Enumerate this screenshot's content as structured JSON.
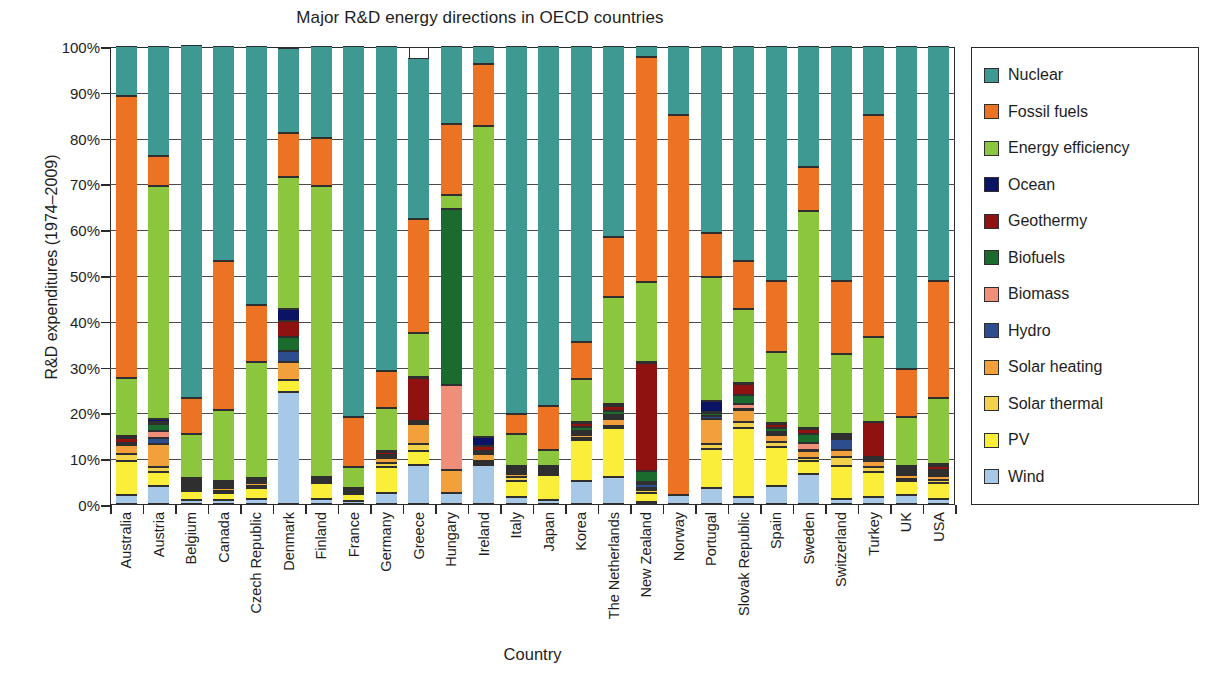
{
  "chart_data": {
    "type": "bar",
    "subtype": "stacked-100-percent",
    "title": "Major R&D energy directions in OECD countries",
    "xlabel": "Country",
    "ylabel": "R&D expenditures (1974–2009)",
    "ylim": [
      0,
      100
    ],
    "ytick_labels": [
      "0%",
      "10%",
      "20%",
      "30%",
      "40%",
      "50%",
      "60%",
      "70%",
      "80%",
      "90%",
      "100%"
    ],
    "ytick_values": [
      0,
      10,
      20,
      30,
      40,
      50,
      60,
      70,
      80,
      90,
      100
    ],
    "grid": true,
    "legend_position": "right",
    "legend_order_top_to_bottom": [
      "Nuclear",
      "Fossil fuels",
      "Energy efficiency",
      "Ocean",
      "Geothermy",
      "Biofuels",
      "Biomass",
      "Hydro",
      "Solar heating",
      "Solar thermal",
      "PV",
      "Wind"
    ],
    "series_colors": {
      "Nuclear": "#3d9991",
      "Fossil fuels": "#ed7324",
      "Energy efficiency": "#8cc63f",
      "Ocean": "#0b1464",
      "Geothermy": "#8f1110",
      "Biofuels": "#1b6b2e",
      "Biomass": "#f08f79",
      "Hydro": "#2e4d8f",
      "Solar heating": "#f2a03c",
      "Solar thermal": "#f2d14b",
      "PV": "#fbee3b",
      "Wind": "#a8c8e8"
    },
    "categories": [
      "Australia",
      "Austria",
      "Belgium",
      "Canada",
      "Czech Republic",
      "Denmark",
      "Finland",
      "France",
      "Germany",
      "Greece",
      "Hungary",
      "Ireland",
      "Italy",
      "Japan",
      "Korea",
      "The Netherlands",
      "New Zealand",
      "Norway",
      "Portugal",
      "Slovak Republic",
      "Spain",
      "Sweden",
      "Switzerland",
      "Turkey",
      "UK",
      "USA"
    ],
    "series": [
      {
        "name": "Wind",
        "values": [
          2.0,
          4.0,
          0.8,
          0.8,
          1.0,
          24.5,
          1.0,
          0.6,
          2.5,
          8.5,
          2.5,
          8.5,
          1.5,
          0.8,
          5.0,
          6.0,
          0.5,
          2.0,
          3.5,
          1.5,
          4.0,
          6.5,
          1.2,
          1.5,
          2.0,
          1.0
        ]
      },
      {
        "name": "PV",
        "values": [
          7.5,
          3.0,
          2.0,
          1.5,
          2.5,
          2.5,
          3.5,
          1.5,
          5.5,
          3.0,
          0.0,
          0.5,
          3.5,
          5.5,
          9.0,
          10.5,
          2.0,
          0.0,
          8.5,
          15.0,
          8.5,
          3.0,
          7.0,
          5.5,
          3.0,
          3.5
        ]
      },
      {
        "name": "Solar thermal",
        "values": [
          1.5,
          1.0,
          0.5,
          0.5,
          0.5,
          0.0,
          0.0,
          0.0,
          1.0,
          1.5,
          0.0,
          0.5,
          0.8,
          0.5,
          0.5,
          0.5,
          0.5,
          0.0,
          1.0,
          1.5,
          1.0,
          0.5,
          2.0,
          1.0,
          0.5,
          0.8
        ]
      },
      {
        "name": "Solar heating",
        "values": [
          1.8,
          5.0,
          0.5,
          0.8,
          0.5,
          4.0,
          0.0,
          0.5,
          1.0,
          4.5,
          5.0,
          1.5,
          0.8,
          0.5,
          0.5,
          1.5,
          0.5,
          0.0,
          5.5,
          2.5,
          1.5,
          1.5,
          1.5,
          1.5,
          0.8,
          0.8
        ]
      },
      {
        "name": "Hydro",
        "values": [
          0.3,
          1.5,
          0.3,
          0.3,
          0.3,
          2.5,
          0.5,
          0.2,
          0.3,
          0.3,
          0.0,
          0.3,
          0.3,
          0.3,
          0.5,
          0.5,
          0.8,
          0.0,
          0.8,
          0.3,
          0.3,
          0.3,
          2.5,
          0.3,
          0.3,
          0.5
        ]
      },
      {
        "name": "Biomass",
        "values": [
          0.0,
          1.5,
          0.5,
          0.3,
          0.0,
          0.0,
          0.0,
          0.0,
          0.0,
          0.0,
          18.5,
          0.0,
          0.3,
          0.0,
          0.5,
          0.5,
          0.5,
          0.0,
          0.0,
          1.0,
          0.5,
          1.5,
          0.0,
          0.0,
          0.3,
          0.3
        ]
      },
      {
        "name": "Biofuels",
        "values": [
          0.3,
          1.5,
          0.5,
          0.3,
          0.3,
          3.0,
          0.5,
          0.3,
          0.5,
          0.3,
          38.5,
          0.3,
          0.5,
          0.3,
          0.8,
          0.8,
          2.5,
          0.0,
          0.5,
          2.0,
          0.8,
          2.0,
          0.5,
          0.5,
          0.5,
          0.5
        ]
      },
      {
        "name": "Geothermy",
        "values": [
          1.1,
          0.5,
          0.3,
          0.3,
          0.3,
          3.5,
          0.3,
          0.3,
          0.5,
          9.5,
          0.0,
          1.0,
          0.3,
          0.3,
          0.8,
          1.0,
          23.5,
          0.0,
          0.3,
          2.5,
          0.8,
          1.0,
          0.3,
          7.5,
          0.5,
          1.0
        ]
      },
      {
        "name": "Ocean",
        "values": [
          0.3,
          0.5,
          0.3,
          0.2,
          0.3,
          2.5,
          0.2,
          0.2,
          0.2,
          0.2,
          0.0,
          2.0,
          0.2,
          0.2,
          0.2,
          0.5,
          0.2,
          0.0,
          2.5,
          0.2,
          0.3,
          0.2,
          0.3,
          0.2,
          0.5,
          0.3
        ]
      },
      {
        "name": "Energy efficiency",
        "values": [
          12.7,
          51.0,
          9.5,
          15.5,
          25.3,
          29.0,
          63.5,
          4.5,
          9.5,
          9.5,
          3.0,
          68.0,
          7.0,
          3.5,
          9.5,
          23.5,
          17.5,
          0.0,
          27.0,
          16.0,
          15.5,
          47.5,
          17.5,
          18.5,
          10.5,
          14.5
        ]
      },
      {
        "name": "Fossil fuels",
        "values": [
          61.5,
          6.5,
          8.0,
          32.5,
          12.5,
          9.5,
          10.5,
          11.0,
          8.0,
          25.0,
          15.5,
          13.5,
          4.5,
          9.5,
          8.0,
          13.0,
          49.0,
          83.0,
          9.5,
          10.5,
          15.5,
          9.5,
          16.0,
          48.5,
          10.5,
          25.5
        ]
      },
      {
        "name": "Nuclear",
        "values": [
          11.0,
          24.0,
          77.0,
          47.0,
          56.5,
          18.5,
          20.0,
          80.9,
          71.0,
          35.0,
          17.0,
          4.0,
          80.3,
          78.6,
          64.7,
          41.7,
          2.5,
          15.0,
          40.9,
          47.0,
          51.3,
          26.5,
          51.2,
          15.0,
          70.6,
          51.3
        ]
      }
    ]
  }
}
